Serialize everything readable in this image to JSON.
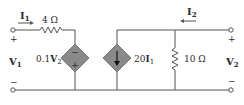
{
  "circuit": {
    "input_current": {
      "label": "I",
      "sub": "1"
    },
    "output_current": {
      "label": "I",
      "sub": "2"
    },
    "series_resistor": "4 Ω",
    "dependent_voltage_source": {
      "coef": "0.1",
      "var": "V",
      "sub": "2",
      "polarity_top": "−",
      "polarity_bottom": "+"
    },
    "dependent_current_source": {
      "coef": "20",
      "var": "I",
      "sub": "1"
    },
    "shunt_resistor": "10 Ω",
    "port1": {
      "label": "V",
      "sub": "1",
      "plus": "+",
      "minus": "−"
    },
    "port2": {
      "label": "V",
      "sub": "2",
      "plus": "+",
      "minus": "−"
    },
    "colors": {
      "wire": "#555555",
      "source_fill": "#8a8a8a",
      "text": "#2b2b2b"
    }
  }
}
